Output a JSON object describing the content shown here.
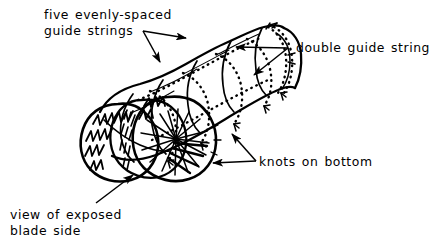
{
  "figure": {
    "background_color": "#ffffff",
    "ink_color": "#000000",
    "annotations": [
      {
        "id": "guide-strings",
        "lines": [
          "five evenly-spaced",
          "guide strings"
        ],
        "line1": "five evenly-spaced",
        "line2": "guide strings",
        "arrow_count": 2,
        "position": "top-left"
      },
      {
        "id": "double-guide-string",
        "lines": [
          "double guide string"
        ],
        "line1": "double guide string",
        "arrow_count": 2,
        "position": "top-right"
      },
      {
        "id": "knots-on-bottom",
        "lines": [
          "knots on bottom"
        ],
        "line1": "knots on bottom",
        "arrow_count": 2,
        "position": "bottom-right"
      },
      {
        "id": "exposed-blade-side",
        "lines": [
          "view of exposed",
          "blade side"
        ],
        "line1": "view of exposed",
        "line2": "blade side",
        "arrow_count": 1,
        "position": "bottom-left"
      }
    ],
    "detail": {
      "guide_string_count": 5,
      "guide_string_style": "dotted",
      "body_style": "solid-outline",
      "end_view": "cross-section with radiating blade hatching"
    }
  }
}
